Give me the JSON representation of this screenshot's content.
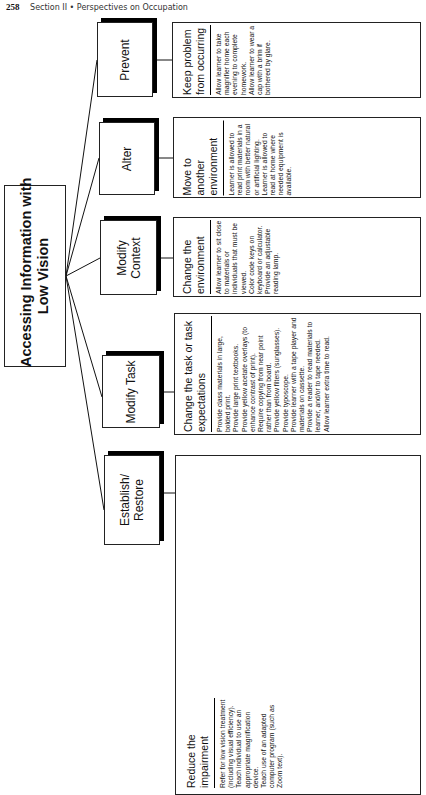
{
  "page_header": {
    "page_number": "258",
    "section": "Section II",
    "separator": "•",
    "title": "Perspectives on Occupation"
  },
  "diagram": {
    "central": "Accessing Information with Low Vision",
    "central_lines": [
      "Accessing Information with",
      "Low Vision"
    ],
    "categories": [
      {
        "label": "Prevent",
        "label_lines": [
          "Prevent"
        ],
        "goal_lines": [
          "Keep problem",
          "from occurring"
        ],
        "items": [
          "Allow learner to take magnifier home each evening to complete homework.",
          "Allow learner to wear a cap with a brim if bothered by glare."
        ]
      },
      {
        "label": "Alter",
        "label_lines": [
          "Alter"
        ],
        "goal_lines": [
          "Move to another",
          "environment"
        ],
        "items": [
          "Learner is allowed to read print materials in a room with better natural or artificial lighting.",
          "Learner is allowed to read at home where needed equipment is available."
        ]
      },
      {
        "label": "Modify Context",
        "label_lines": [
          "Modify",
          "Context"
        ],
        "goal_lines": [
          "Change the",
          "environment"
        ],
        "items": [
          "Allow learner to sit close to materials or individuals that must be viewed.",
          "Color code keys on keyboard or calculator.",
          "Provide an adjustable reading lamp."
        ]
      },
      {
        "label": "Modify Task",
        "label_lines": [
          "Modify Task"
        ],
        "goal_lines": [
          "Change the task or task",
          "expectations"
        ],
        "items": [
          "Provide class materials in large, bolded print.",
          "Provide large print textbooks.",
          "Provide yellow acetate overlays (to enhance contrast of print).",
          "Require copying from near point rather than from board.",
          "Provide yellow filters (sunglasses).",
          "Provide typoscope.",
          "Provide learner with a tape player and materials on cassette.",
          "Provide a reader to read materials to learner, and/or to tape needed.",
          "Allow learner extra time to read."
        ]
      },
      {
        "label": "Establish/Restore",
        "label_lines": [
          "Establish/",
          "Restore"
        ],
        "goal_lines": [
          "Reduce the",
          "impairment"
        ],
        "items": [
          "Refer for low vision treatment (including visual efficiency).",
          "Teach individual to use an appropriate magnification device.",
          "Teach use of an adapted computer program (such as Zoom text)."
        ]
      }
    ]
  }
}
